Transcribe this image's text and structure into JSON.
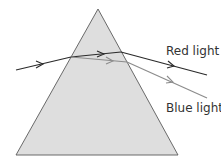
{
  "diagram": {
    "colors": {
      "prism_fill": "#dedede",
      "prism_stroke": "#5a5a5a",
      "red_ray": "#2a2a2a",
      "blue_ray": "#8c8c8c",
      "label_text": "#333333"
    },
    "labels": {
      "red": "Red light",
      "blue": "Blue light"
    }
  }
}
